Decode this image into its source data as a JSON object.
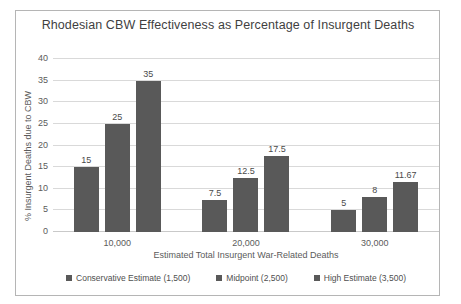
{
  "chart_data": {
    "type": "bar",
    "title": "Rhodesian CBW Effectiveness as Percentage of Insurgent Deaths",
    "xlabel": "Estimated Total Insurgent War-Related Deaths",
    "ylabel": "% Insurgent Deaths due to CBW",
    "categories": [
      "10,000",
      "20,000",
      "30,000"
    ],
    "series": [
      {
        "name": "Conservative Estimate (1,500)",
        "values": [
          15,
          7.5,
          5
        ],
        "labels": [
          "15",
          "7.5",
          "5"
        ]
      },
      {
        "name": "Midpoint (2,500)",
        "values": [
          25,
          12.5,
          8
        ],
        "labels": [
          "25",
          "12.5",
          "8"
        ]
      },
      {
        "name": "High Estimate (3,500)",
        "values": [
          35,
          17.5,
          11.67
        ],
        "labels": [
          "35",
          "17.5",
          "11.67"
        ]
      }
    ],
    "ylim": [
      0,
      40
    ],
    "yticks": [
      "0",
      "5",
      "10",
      "15",
      "20",
      "25",
      "30",
      "35",
      "40"
    ],
    "grid": true,
    "legend_position": "bottom",
    "bar_color": "#595959",
    "gridline_color": "#d9d9d9",
    "text_color": "#5b5b5b",
    "title_color": "#3f3f3f",
    "border_color": "#b5b5b5"
  }
}
